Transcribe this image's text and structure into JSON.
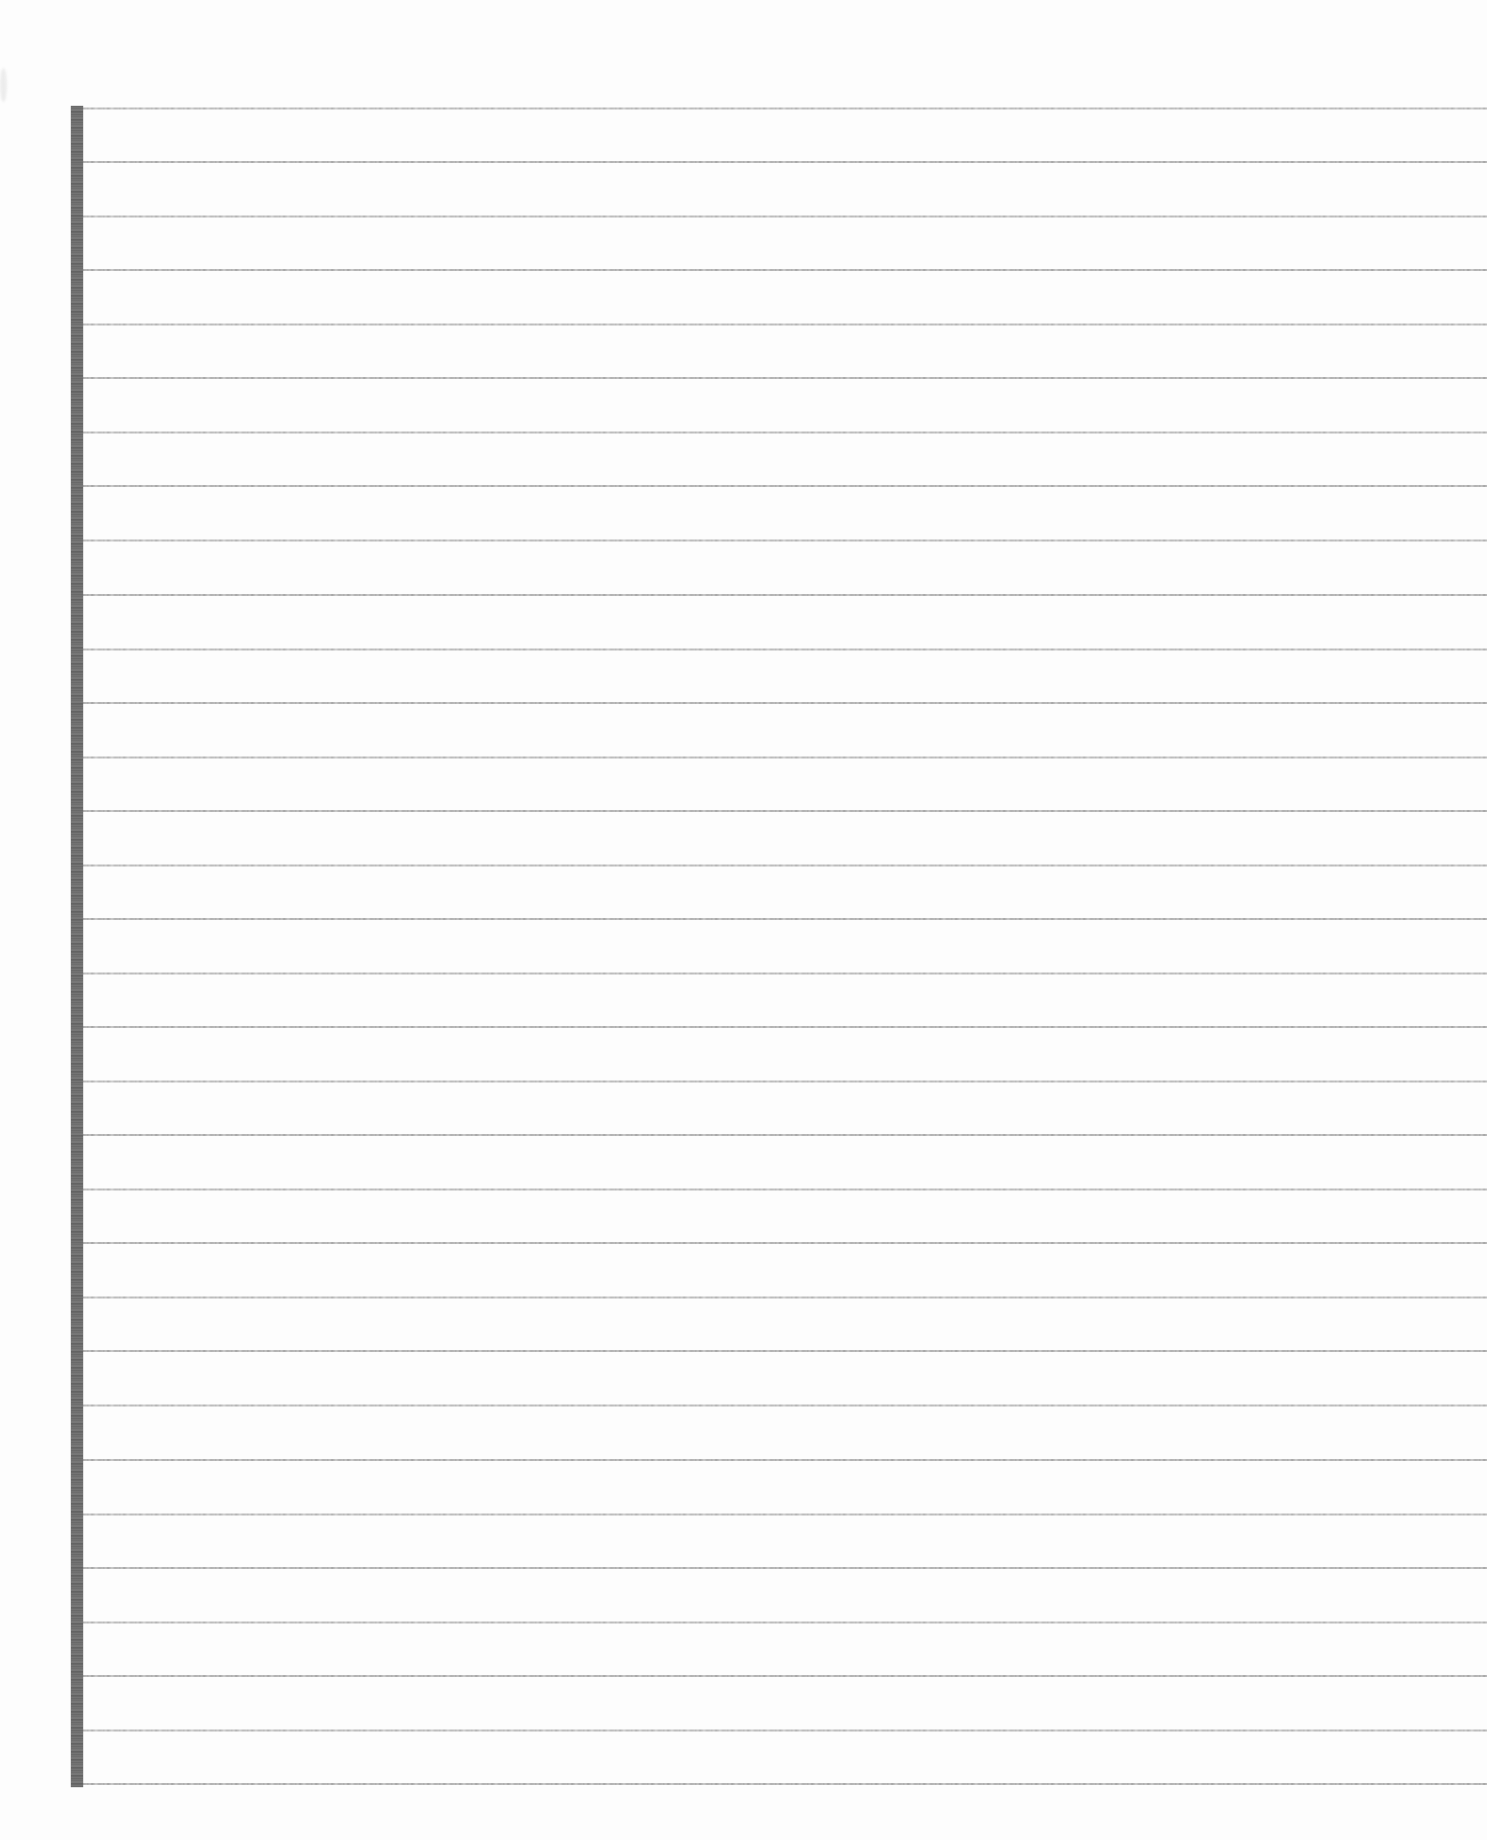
{
  "document": {
    "kind": "scanned blank ruled notebook page",
    "text_content": "",
    "ruled_lines": {
      "count": 32
    },
    "colors": {
      "paper": "#fdfdfd",
      "rule_line": "#a6a6a6",
      "margin_bar": "#6f6f6f"
    }
  }
}
